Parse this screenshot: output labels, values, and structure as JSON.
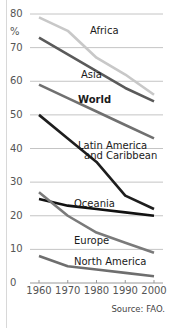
{
  "chart_data": {
    "type": "line",
    "title": "",
    "xlabel": "",
    "ylabel": "%",
    "ylim": [
      0,
      80
    ],
    "yticks": [
      0,
      10,
      20,
      30,
      40,
      50,
      60,
      70,
      80
    ],
    "x": [
      1960,
      1970,
      1980,
      1990,
      2000
    ],
    "xtick_labels": [
      "1960",
      "1970",
      "1980",
      "1990",
      "2000"
    ],
    "grid": "horizontal",
    "series": [
      {
        "name": "Africa",
        "color": "#c8c8c8",
        "values": [
          79,
          75,
          67,
          62,
          56
        ]
      },
      {
        "name": "Asia",
        "color": "#5a5a5a",
        "values": [
          73,
          68,
          63,
          58,
          54
        ]
      },
      {
        "name": "World",
        "color": "#707070",
        "values": [
          59,
          55,
          51,
          47,
          43
        ]
      },
      {
        "name": "Latin America and Caribbean",
        "color": "#1e1e1e",
        "values": [
          50,
          43,
          36,
          26,
          22
        ]
      },
      {
        "name": "Oceania",
        "color": "#111111",
        "values": [
          25,
          23,
          22,
          21,
          20
        ]
      },
      {
        "name": "Europe",
        "color": "#7a7a7a",
        "values": [
          27,
          20,
          15,
          12,
          9
        ]
      },
      {
        "name": "North America",
        "color": "#6e6e6e",
        "values": [
          8,
          5,
          4,
          3,
          2
        ]
      }
    ],
    "labels": {
      "africa": "Africa",
      "asia": "Asia",
      "world": "World",
      "latin_line1": "Latin America",
      "latin_line2": "and Caribbean",
      "oceania": "Oceania",
      "europe": "Europe",
      "north_america": "North America"
    },
    "source": "Source: FAO."
  }
}
